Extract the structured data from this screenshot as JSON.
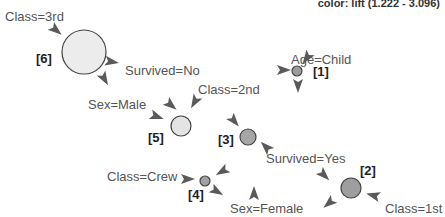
{
  "legend": {
    "color_text": "color: lift (1.222 - 3.096)"
  },
  "items": [
    {
      "id": "class-3rd",
      "label": "Class=3rd",
      "x": 5,
      "y": 21
    },
    {
      "id": "survived-no",
      "label": "Survived=No",
      "x": 125,
      "y": 75
    },
    {
      "id": "age-child",
      "label": "Age=Child",
      "x": 291,
      "y": 64
    },
    {
      "id": "class-2nd",
      "label": "Class=2nd",
      "x": 198,
      "y": 94
    },
    {
      "id": "sex-male",
      "label": "Sex=Male",
      "x": 88,
      "y": 109
    },
    {
      "id": "survived-yes",
      "label": "Survived=Yes",
      "x": 266,
      "y": 163
    },
    {
      "id": "class-crew",
      "label": "Class=Crew",
      "x": 107,
      "y": 181
    },
    {
      "id": "sex-female",
      "label": "Sex=Female",
      "x": 230,
      "y": 213
    },
    {
      "id": "class-1st",
      "label": "Class=1st",
      "x": 385,
      "y": 213
    }
  ],
  "rules": [
    {
      "index": "[6]",
      "cx": 84,
      "cy": 52,
      "r": 22,
      "fill": "#ececec",
      "label_x": 36,
      "label_y": 63
    },
    {
      "index": "[5]",
      "cx": 181,
      "cy": 126,
      "r": 10,
      "fill": "#e4e4e4",
      "label_x": 148,
      "label_y": 142
    },
    {
      "index": "[3]",
      "cx": 248,
      "cy": 137,
      "r": 8,
      "fill": "#a6a6a6",
      "label_x": 218,
      "label_y": 144
    },
    {
      "index": "[1]",
      "cx": 297,
      "cy": 71,
      "r": 5,
      "fill": "#9c9c9c",
      "label_x": 313,
      "label_y": 76
    },
    {
      "index": "[4]",
      "cx": 205,
      "cy": 181,
      "r": 5,
      "fill": "#a2a2a2",
      "label_x": 188,
      "label_y": 199
    },
    {
      "index": "[2]",
      "cx": 351,
      "cy": 188,
      "r": 10,
      "fill": "#9e9e9e",
      "label_x": 360,
      "label_y": 175
    }
  ],
  "arrows": [
    {
      "x": 57,
      "y": 31,
      "angle": 40
    },
    {
      "x": 113,
      "y": 62,
      "angle": 10
    },
    {
      "x": 105,
      "y": 80,
      "angle": 60
    },
    {
      "x": 172,
      "y": 106,
      "angle": 40
    },
    {
      "x": 194,
      "y": 103,
      "angle": 120
    },
    {
      "x": 158,
      "y": 117,
      "angle": 20
    },
    {
      "x": 235,
      "y": 122,
      "angle": 50
    },
    {
      "x": 285,
      "y": 70,
      "angle": 0
    },
    {
      "x": 306,
      "y": 59,
      "angle": 125
    },
    {
      "x": 298,
      "y": 87,
      "angle": 90
    },
    {
      "x": 265,
      "y": 146,
      "angle": 225
    },
    {
      "x": 325,
      "y": 176,
      "angle": 45
    },
    {
      "x": 328,
      "y": 204,
      "angle": 140
    },
    {
      "x": 372,
      "y": 195,
      "angle": 195
    },
    {
      "x": 189,
      "y": 179,
      "angle": 0
    },
    {
      "x": 221,
      "y": 172,
      "angle": 150
    },
    {
      "x": 218,
      "y": 192,
      "angle": 30
    },
    {
      "x": 254,
      "y": 192,
      "angle": 270
    }
  ]
}
